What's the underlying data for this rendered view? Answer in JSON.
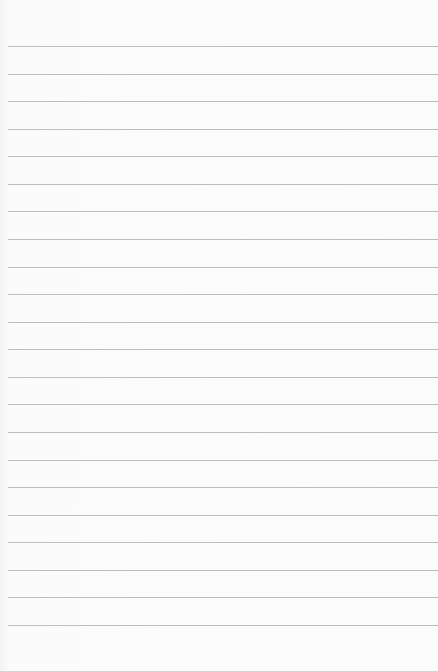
{
  "page": {
    "type": "lined-paper",
    "background_color": "#fafafa",
    "line_color": "#bcbcbc",
    "line_count": 22,
    "first_line_y": 46,
    "line_spacing": 27.57
  }
}
